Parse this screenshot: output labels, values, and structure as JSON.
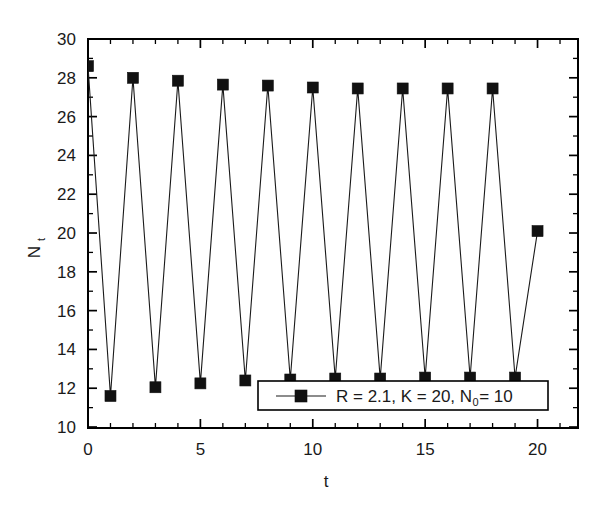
{
  "chart_data": {
    "type": "line",
    "title": "",
    "subtitle": "",
    "xlabel": "t",
    "ylabel": "N_t",
    "ylabel_base": "N",
    "ylabel_sub": "t",
    "xlim": [
      0,
      21.8
    ],
    "ylim": [
      9.95,
      30
    ],
    "xticks": [
      0,
      5,
      10,
      15,
      20
    ],
    "xticklabels": [
      "0",
      "5",
      "10",
      "15",
      "20"
    ],
    "yticks": [
      10,
      12,
      14,
      16,
      18,
      20,
      22,
      24,
      26,
      28,
      30
    ],
    "yticklabels": [
      "10",
      "12",
      "14",
      "16",
      "18",
      "20",
      "22",
      "24",
      "26",
      "28",
      "30"
    ],
    "x_minor_step": 1,
    "y_minor_step": 1,
    "grid": false,
    "legend_position": "lower center",
    "marker": "square",
    "marker_size": 11,
    "line_color": "#1a1a1a",
    "marker_color": "#111111",
    "series": [
      {
        "name": "R = 2.1, K = 20, N_0 = 10",
        "name_parts": {
          "before_sub": "R = 2.1, K = 20, N",
          "sub": "0",
          "after_sub": " = 10"
        },
        "x": [
          0,
          1,
          2,
          3,
          4,
          5,
          6,
          7,
          8,
          9,
          10,
          11,
          12,
          13,
          14,
          15,
          16,
          17,
          18,
          19,
          20
        ],
        "values": [
          28.6,
          11.6,
          28.0,
          12.05,
          27.85,
          12.25,
          27.65,
          12.4,
          27.6,
          12.45,
          27.5,
          12.5,
          27.45,
          12.5,
          27.45,
          12.55,
          27.45,
          12.55,
          27.45,
          12.55,
          20.1
        ]
      }
    ],
    "annotations": []
  },
  "legend": {
    "entries": [
      {
        "label_before_sub": "R = 2.1, K = 20, N",
        "label_sub": "0",
        "label_after_sub": " = 10"
      }
    ]
  },
  "axes": {
    "x_title": "t",
    "y_title_base": "N",
    "y_title_sub": "t"
  }
}
